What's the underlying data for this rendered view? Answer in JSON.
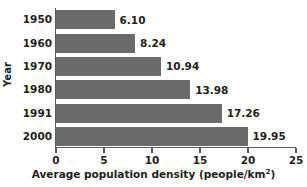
{
  "chart_data": {
    "type": "bar",
    "orientation": "horizontal",
    "title": "",
    "categories": [
      "1950",
      "1960",
      "1970",
      "1980",
      "1991",
      "2000"
    ],
    "values": [
      6.1,
      8.24,
      10.94,
      13.98,
      17.26,
      19.95
    ],
    "data_labels": [
      "6.10",
      "8.24",
      "10.94",
      "13.98",
      "17.26",
      "19.95"
    ],
    "xlabel": "Average population density (people/km",
    "xlabel_superscript": "2",
    "xlabel_suffix": ")",
    "xlabel_full": "Average population density (people/km2)",
    "ylabel": "Year",
    "xlim": [
      0,
      25
    ],
    "xticks": [
      0,
      5,
      10,
      15,
      20,
      25
    ],
    "xtick_labels": [
      "0",
      "5",
      "10",
      "15",
      "20",
      "25"
    ],
    "grid": false,
    "legend": false,
    "bar_color": "#6b6b6b",
    "axis_color": "#58595b",
    "text_color": "#231f20",
    "background_color": "#ffffff"
  }
}
